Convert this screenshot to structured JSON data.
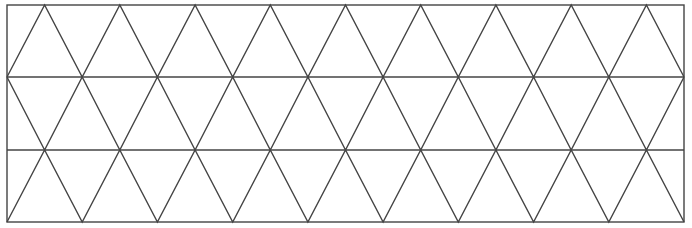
{
  "diagram": {
    "type": "triangular-grid",
    "rows": 3,
    "triangles_per_row_up": 9,
    "columns": 9,
    "frame": {
      "x0": 7,
      "y0": 5,
      "x1": 684,
      "y1": 222
    },
    "band_lines_y": [
      77,
      150
    ],
    "stroke_color": "#444444",
    "background_color": "#ffffff",
    "stroke_width": 1.4
  }
}
